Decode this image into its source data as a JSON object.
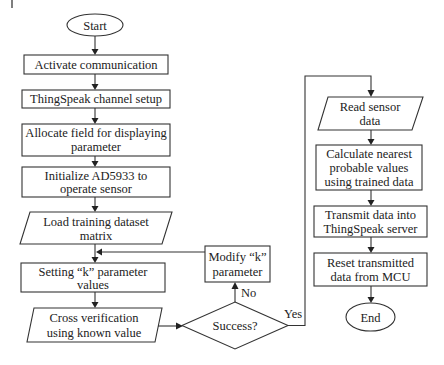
{
  "diagram": {
    "type": "flowchart",
    "nodes": {
      "start": {
        "label": "Start",
        "shape": "terminator"
      },
      "activate": {
        "label": "Activate communication",
        "shape": "process"
      },
      "channel": {
        "label": "ThingSpeak channel setup",
        "shape": "process"
      },
      "allocate": {
        "lines": [
          "Allocate field for displaying",
          "parameter"
        ],
        "shape": "process"
      },
      "initialize": {
        "lines": [
          "Initialize AD5933 to",
          "operate sensor"
        ],
        "shape": "process"
      },
      "load": {
        "lines": [
          "Load training dataset",
          "matrix"
        ],
        "shape": "data"
      },
      "setting": {
        "lines": [
          "Setting “k” parameter",
          "values"
        ],
        "shape": "process"
      },
      "cross": {
        "lines": [
          "Cross verification",
          "using known value"
        ],
        "shape": "data"
      },
      "decision": {
        "label": "Success?",
        "shape": "decision"
      },
      "modify": {
        "lines": [
          "Modify “k”",
          "parameter"
        ],
        "shape": "process"
      },
      "read": {
        "lines": [
          "Read sensor",
          "data"
        ],
        "shape": "data"
      },
      "calculate": {
        "lines": [
          "Calculate nearest",
          "probable values",
          "using trained data"
        ],
        "shape": "process"
      },
      "transmit": {
        "lines": [
          "Transmit data into",
          "ThingSpeak server"
        ],
        "shape": "process"
      },
      "reset": {
        "lines": [
          "Reset transmitted",
          "data from MCU"
        ],
        "shape": "process"
      },
      "end": {
        "label": "End",
        "shape": "terminator"
      }
    },
    "edge_labels": {
      "no": "No",
      "yes": "Yes"
    },
    "edges": [
      [
        "start",
        "activate"
      ],
      [
        "activate",
        "channel"
      ],
      [
        "channel",
        "allocate"
      ],
      [
        "allocate",
        "initialize"
      ],
      [
        "initialize",
        "load"
      ],
      [
        "load",
        "setting"
      ],
      [
        "setting",
        "cross"
      ],
      [
        "cross",
        "decision"
      ],
      [
        "decision",
        "modify",
        "No"
      ],
      [
        "modify",
        "setting"
      ],
      [
        "decision",
        "read",
        "Yes"
      ],
      [
        "read",
        "calculate"
      ],
      [
        "calculate",
        "transmit"
      ],
      [
        "transmit",
        "reset"
      ],
      [
        "reset",
        "end"
      ]
    ]
  }
}
